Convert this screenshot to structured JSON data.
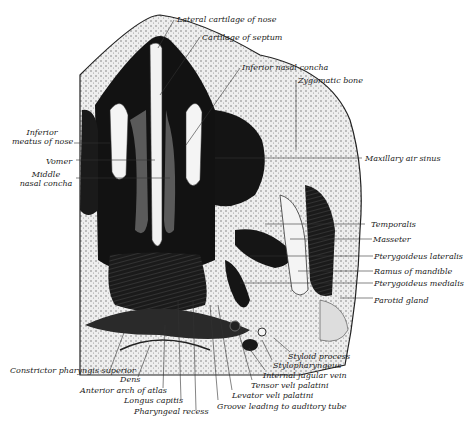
{
  "figure": {
    "colors": {
      "ink": "#111111",
      "paper": "#ffffff",
      "tissue_light": "#e6e6e6",
      "tissue_mid": "#9a9a9a"
    }
  },
  "labels": {
    "lateral_cartilage": "Lateral cartilage of nose",
    "cartilage_septum": "Cartilage of septum",
    "inferior_concha": "Inferior nasal concha",
    "zygomatic": "Zygomatic bone",
    "inferior_meatus_1": "Inferior",
    "inferior_meatus_2": "meatus of nose",
    "vomer": "Vomer",
    "middle_concha_1": "Middle",
    "middle_concha_2": "nasal concha",
    "maxillary_sinus": "Maxillary air sinus",
    "temporalis": "Temporalis",
    "masseter": "Masseter",
    "pteryg_lateralis": "Pterygoideus lateralis",
    "ramus": "Ramus of mandible",
    "pteryg_medialis": "Pterygoideus medialis",
    "parotid": "Parotid gland",
    "styloid": "Styloid process",
    "stylopharyngeus": "Stylopharyngeus",
    "jugular": "Internal jugular vein",
    "tensor": "Tensor veli palatini",
    "levator": "Levator veli palatini",
    "groove": "Groove leading to auditory tube",
    "constrictor": "Constrictor pharyngis superior",
    "dens": "Dens",
    "anterior_arch": "Anterior arch of atlas",
    "longus": "Longus capitis",
    "pharyngeal_recess": "Pharyngeal recess"
  }
}
